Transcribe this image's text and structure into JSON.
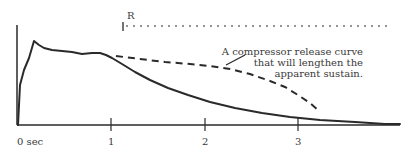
{
  "diagram": {
    "title": "",
    "axis": {
      "x_labels": [
        "0 sec",
        "1",
        "2",
        "3"
      ]
    },
    "release_marker": {
      "label": "R"
    },
    "annotation": {
      "lines": [
        "A compressor release curve",
        "that will lengthen the",
        "apparent sustain."
      ]
    },
    "curves": [
      {
        "name": "original-envelope",
        "style": "solid"
      },
      {
        "name": "compressor-release-curve",
        "style": "dashed"
      }
    ],
    "colors": {
      "ink": "#2a2a2a",
      "background": "#ffffff"
    }
  }
}
